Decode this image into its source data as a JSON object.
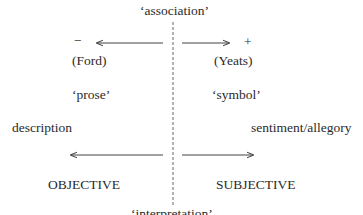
{
  "diagram": {
    "top_label": "‘association’",
    "bottom_label": "‘interpretation’",
    "left": {
      "sign": "−",
      "author": "(Ford)",
      "mode": "‘prose’",
      "genre": "description",
      "pole": "OBJECTIVE"
    },
    "right": {
      "sign": "+",
      "author": "(Yeats)",
      "mode": "‘symbol’",
      "genre": "sentiment/allegory",
      "pole": "SUBJECTIVE"
    },
    "colors": {
      "ink": "#2a2a2a",
      "line": "#555555"
    }
  }
}
